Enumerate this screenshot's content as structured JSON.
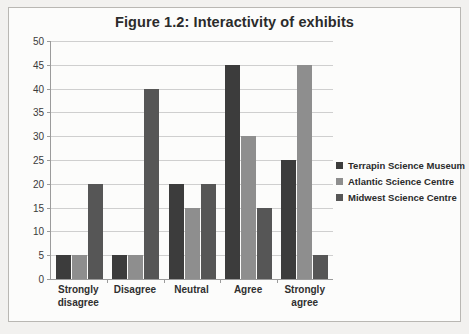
{
  "chart_data": {
    "type": "bar",
    "title": "Figure 1.2: Interactivity of exhibits",
    "xlabel": "",
    "ylabel": "",
    "categories": [
      "Strongly disagree",
      "Disagree",
      "Neutral",
      "Agree",
      "Strongly agree"
    ],
    "category_lines": [
      [
        "Strongly",
        "disagree"
      ],
      [
        "Disagree"
      ],
      [
        "Neutral"
      ],
      [
        "Agree"
      ],
      [
        "Strongly",
        "agree"
      ]
    ],
    "series": [
      {
        "name": "Terrapin Science Museum",
        "color": "#3c3c3c",
        "values": [
          5,
          5,
          20,
          45,
          25
        ]
      },
      {
        "name": "Atlantic Science Centre",
        "color": "#8e8e8e",
        "values": [
          5,
          5,
          15,
          30,
          45
        ]
      },
      {
        "name": "Midwest Science Centre",
        "color": "#565656",
        "values": [
          20,
          40,
          20,
          15,
          5
        ]
      }
    ],
    "ylim": [
      0,
      50
    ],
    "ytick_step": 5,
    "yticks": [
      0,
      5,
      10,
      15,
      20,
      25,
      30,
      35,
      40,
      45,
      50
    ],
    "ytick_labels": [
      "0",
      "5",
      "10",
      "15",
      "20",
      "25",
      "30",
      "35",
      "40",
      "45",
      "50"
    ],
    "grid": true,
    "grid_axis": "y",
    "legend_position": "right",
    "background": "#fcfcfb",
    "border_color": "#b9b7b3"
  }
}
